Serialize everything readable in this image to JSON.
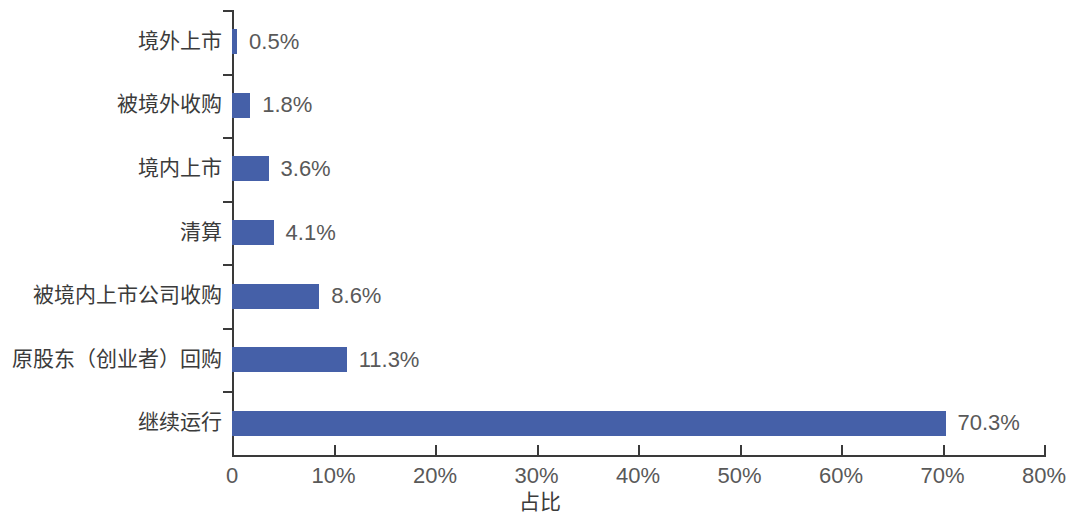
{
  "chart_data": {
    "type": "bar",
    "orientation": "horizontal",
    "title": "",
    "xlabel": "占比",
    "ylabel": "",
    "xlim": [
      0,
      80
    ],
    "grid": false,
    "legend": null,
    "bar_color": "#4560a8",
    "categories": [
      "境外上市",
      "被境外收购",
      "境内上市",
      "清算",
      "被境内上市公司收购",
      "原股东（创业者）回购",
      "继续运行"
    ],
    "values": [
      0.5,
      1.8,
      3.6,
      4.1,
      8.6,
      11.3,
      70.3
    ],
    "value_labels": [
      "0.5%",
      "1.8%",
      "3.6%",
      "4.1%",
      "8.6%",
      "11.3%",
      "70.3%"
    ],
    "xticks": [
      0,
      10,
      20,
      30,
      40,
      50,
      60,
      70,
      80
    ],
    "xtick_labels": [
      "0",
      "10%",
      "20%",
      "30%",
      "40%",
      "50%",
      "60%",
      "70%",
      "80%"
    ]
  }
}
